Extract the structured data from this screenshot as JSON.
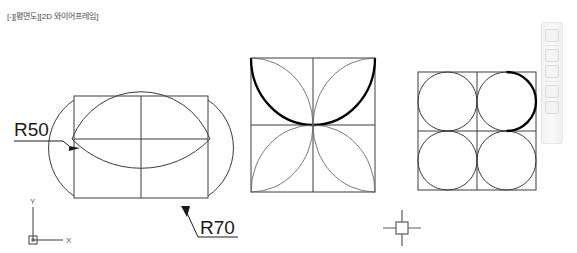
{
  "viewport": {
    "label": "[-][평면도][2D 와이어프레임]"
  },
  "ucs_icon": {
    "x_label": "X",
    "y_label": "Y"
  },
  "dimensions": {
    "r50": "R50",
    "r70": "R70"
  },
  "colors": {
    "background": "#ffffff",
    "geometry": "#3c3c3c",
    "highlight": "#000000",
    "text": "#1a1a1a",
    "ucs": "#5b5b5b"
  },
  "nav_bar": {
    "icons": [
      "pan-icon",
      "orbit-icon",
      "zoom-icon",
      "steeringwheel-icon",
      "showmotion-icon"
    ]
  },
  "figures": [
    {
      "name": "square-with-bulging-arcs",
      "radii": [
        "R50",
        "R70"
      ],
      "description": "rectangle with center crosshair lines and four outward bulging arcs"
    },
    {
      "name": "four-petal-flower",
      "description": "square divided in quadrants with four semicircular petals, top arcs highlighted"
    },
    {
      "name": "four-circle-cluster",
      "description": "2x2 grid of squares each inscribing a circle, top-right arc highlighted"
    }
  ]
}
